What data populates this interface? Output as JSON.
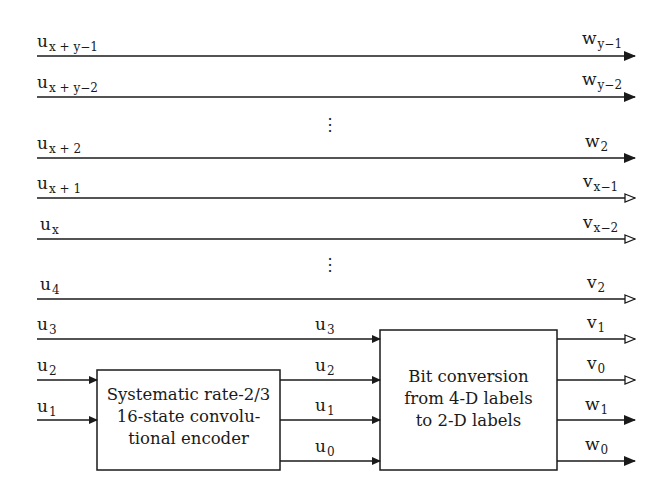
{
  "diagram": {
    "type": "block-diagram",
    "inputs": [
      {
        "id": "in-xy1",
        "base": "u",
        "sub": "x + y−1",
        "y": 56
      },
      {
        "id": "in-xy2",
        "base": "u",
        "sub": "x + y−2",
        "y": 97
      },
      {
        "id": "in-x2",
        "base": "u",
        "sub": "x + 2",
        "y": 158
      },
      {
        "id": "in-x1",
        "base": "u",
        "sub": "x + 1",
        "y": 198
      },
      {
        "id": "in-x",
        "base": "u",
        "sub": "x",
        "y": 239
      },
      {
        "id": "in-4",
        "base": "u",
        "sub": "4",
        "y": 299
      },
      {
        "id": "in-3",
        "base": "u",
        "sub": "3",
        "y": 339
      },
      {
        "id": "in-2",
        "base": "u",
        "sub": "2",
        "y": 380
      },
      {
        "id": "in-1",
        "base": "u",
        "sub": "1",
        "y": 420
      }
    ],
    "outputs": [
      {
        "id": "out-wy1",
        "base": "w",
        "sub": "y−1",
        "y": 56,
        "arrow": "filled"
      },
      {
        "id": "out-wy2",
        "base": "w",
        "sub": "y−2",
        "y": 97,
        "arrow": "filled"
      },
      {
        "id": "out-w2",
        "base": "w",
        "sub": "2",
        "y": 158,
        "arrow": "filled"
      },
      {
        "id": "out-vx1",
        "base": "v",
        "sub": "x−1",
        "y": 198,
        "arrow": "open"
      },
      {
        "id": "out-vx2",
        "base": "v",
        "sub": "x−2",
        "y": 239,
        "arrow": "open"
      },
      {
        "id": "out-v2",
        "base": "v",
        "sub": "2",
        "y": 299,
        "arrow": "open"
      },
      {
        "id": "out-v1",
        "base": "v",
        "sub": "1",
        "y": 339,
        "arrow": "open"
      },
      {
        "id": "out-v0",
        "base": "v",
        "sub": "0",
        "y": 380,
        "arrow": "open"
      },
      {
        "id": "out-w1",
        "base": "w",
        "sub": "1",
        "y": 420,
        "arrow": "filled"
      },
      {
        "id": "out-w0",
        "base": "w",
        "sub": "0",
        "y": 461,
        "arrow": "filled"
      }
    ],
    "middle_labels": [
      {
        "base": "u",
        "sub": "3"
      },
      {
        "base": "u",
        "sub": "2"
      },
      {
        "base": "u",
        "sub": "1"
      },
      {
        "base": "u",
        "sub": "0"
      }
    ],
    "encoder": {
      "lines": [
        "Systematic rate-2/3",
        "16-state convolu-",
        "tional encoder"
      ]
    },
    "converter": {
      "lines": [
        "Bit conversion",
        "from 4-D labels",
        "to 2-D labels"
      ]
    },
    "ellipsis": "⋮"
  }
}
